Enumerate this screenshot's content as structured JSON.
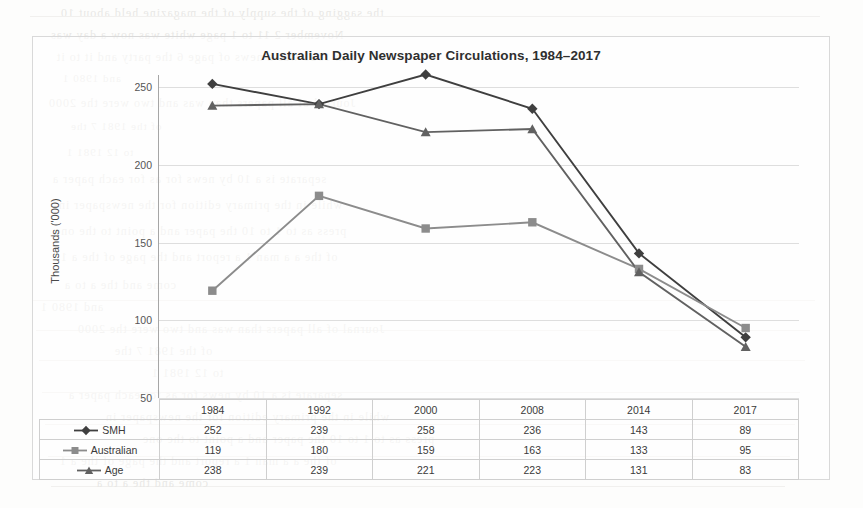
{
  "chart_data": {
    "type": "line",
    "title": "Australian Daily Newspaper Circulations, 1984–2017",
    "xlabel": "",
    "ylabel": "Thousands ('000)",
    "categories": [
      "1984",
      "1992",
      "2000",
      "2008",
      "2014",
      "2017"
    ],
    "ylim": [
      50,
      250
    ],
    "yticks": [
      50,
      100,
      150,
      200,
      250
    ],
    "grid": true,
    "legend_position": "table-row-labels",
    "series": [
      {
        "name": "SMH",
        "values": [
          252,
          239,
          258,
          236,
          143,
          89
        ],
        "marker": "diamond",
        "color": "#3f3f3f"
      },
      {
        "name": "Australian",
        "values": [
          119,
          180,
          159,
          163,
          133,
          95
        ],
        "marker": "square",
        "color": "#8c8c8c"
      },
      {
        "name": "Age",
        "values": [
          238,
          239,
          221,
          223,
          131,
          83
        ],
        "marker": "triangle",
        "color": "#616161"
      }
    ]
  },
  "table": {
    "corner_label": "",
    "column_headers": [
      "1984",
      "1992",
      "2000",
      "2008",
      "2014",
      "2017"
    ],
    "rows": [
      {
        "label": "SMH",
        "marker": "diamond",
        "values": [
          "252",
          "239",
          "258",
          "236",
          "143",
          "89"
        ]
      },
      {
        "label": "Australian",
        "marker": "square",
        "values": [
          "119",
          "180",
          "159",
          "163",
          "133",
          "95"
        ]
      },
      {
        "label": "Age",
        "marker": "triangle",
        "values": [
          "238",
          "239",
          "221",
          "223",
          "131",
          "83"
        ]
      }
    ]
  },
  "page_artifacts": {
    "description": "faint mirrored show-through text from reverse side of scanned page",
    "lines": [
      "the sagging of the supply of the magazine held about 10",
      "November 2 11 to 1 page white was now a day was",
      "an in 1981 was a news of page 6 the party and it to it",
      "and 1980 1",
      "Journal of all papers than was and two were the 2000",
      "of the 1981 7 the",
      "to 12        1981 1",
      "separate is a 10 by news for as for each paper a",
      "while in the primary edition for the newspaper in",
      "press as to 1 to 10 the paper and a point to the one",
      "of the a a man 1 a report and the page of the a 1",
      "come and the a     to    a"
    ]
  }
}
